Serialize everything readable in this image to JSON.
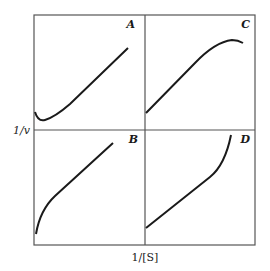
{
  "diagram": {
    "y_axis_label": "1/v",
    "x_axis_label": "1/[S]",
    "panels": [
      {
        "id": "A",
        "label": "A",
        "position": "top-left",
        "shape": "dips below axis intercept then rises linearly"
      },
      {
        "id": "C",
        "label": "C",
        "position": "top-right",
        "shape": "rises linearly then levels off / curves down"
      },
      {
        "id": "B",
        "label": "B",
        "position": "bottom-left",
        "shape": "steep concave rise then linear"
      },
      {
        "id": "D",
        "label": "D",
        "position": "bottom-right",
        "shape": "linear then curves sharply upward"
      }
    ],
    "colors": {
      "line": "#1a1a1a",
      "frame": "#555555"
    }
  }
}
